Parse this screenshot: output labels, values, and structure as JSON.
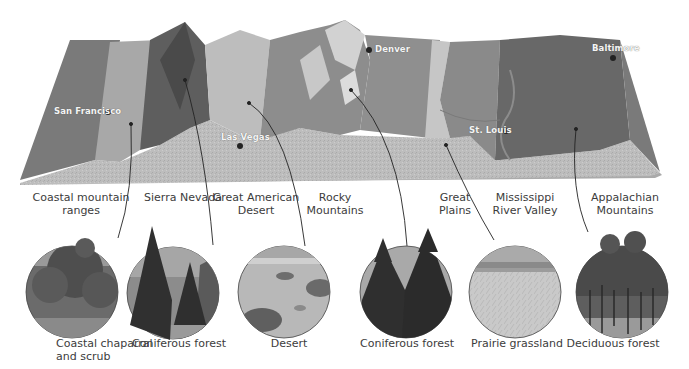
{
  "diagram": {
    "type": "terrain-cross-section-biomes",
    "colors": {
      "ocean_left": "#7a7a7a",
      "terrain_front": "#b9b9b9",
      "plains_mid": "#8f8f8f",
      "plains_light": "#c6c6c6",
      "appalachian": "#666666",
      "mountain_dark": "#5a5a5a",
      "mountain_light": "#cfcfcf",
      "leader_line": "#222222",
      "text": "#3c3c3c"
    },
    "cities": [
      {
        "name": "San Francisco"
      },
      {
        "name": "Las Vegas"
      },
      {
        "name": "Denver"
      },
      {
        "name": "St. Louis"
      },
      {
        "name": "Baltimore"
      }
    ],
    "regions": [
      {
        "line1": "Coastal mountain",
        "line2": "ranges"
      },
      {
        "line1": "Sierra Nevada",
        "line2": ""
      },
      {
        "line1": "Great American",
        "line2": "Desert"
      },
      {
        "line1": "Rocky",
        "line2": "Mountains"
      },
      {
        "line1": "Great",
        "line2": "Plains"
      },
      {
        "line1": "Mississippi",
        "line2": "River Valley"
      },
      {
        "line1": "Appalachian",
        "line2": "Mountains"
      }
    ],
    "biomes": [
      {
        "line1": "Coastal chaparral",
        "line2": "and scrub",
        "photo": "chaparral-photo"
      },
      {
        "line1": "Coniferous forest",
        "line2": "",
        "photo": "conifer-photo"
      },
      {
        "line1": "Desert",
        "line2": "",
        "photo": "desert-photo"
      },
      {
        "line1": "Coniferous forest",
        "line2": "",
        "photo": "conifer-photo"
      },
      {
        "line1": "Prairie grassland",
        "line2": "",
        "photo": "grassland-photo"
      },
      {
        "line1": "Deciduous forest",
        "line2": "",
        "photo": "deciduous-photo"
      }
    ]
  }
}
